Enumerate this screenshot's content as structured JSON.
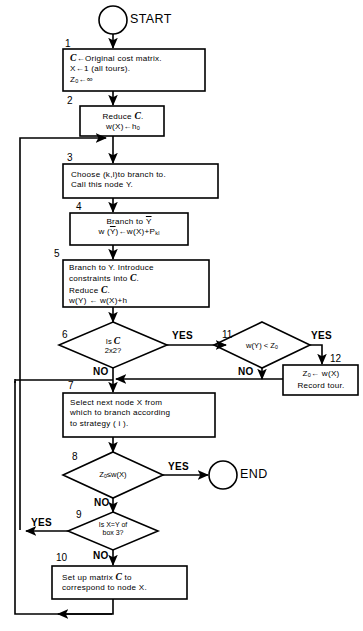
{
  "diagram": {
    "terminals": {
      "start": "START",
      "end": "END"
    },
    "numbers": {
      "n1": "1",
      "n2": "2",
      "n3": "3",
      "n4": "4",
      "n5": "5",
      "n6": "6",
      "n7": "7",
      "n8": "8",
      "n9": "9",
      "n10": "10",
      "n11": "11",
      "n12": "12"
    },
    "nodes": {
      "box1": {
        "line1_sym": "C",
        "line1": "←Original cost matrix.",
        "line2": "X←1 (all tours).",
        "line3_sym": "Z",
        "line3_sub": "0",
        "line3": "←∞"
      },
      "box2": {
        "line1": "Reduce",
        "line1_sym": "C",
        "line1_end": ".",
        "line2": "w(X)←h",
        "line2_sub": "0"
      },
      "box3": {
        "line1": "Choose (k,l)to branch to.",
        "line2": "Call this node Y."
      },
      "box4": {
        "line1": "Branch to",
        "line1_ovr": "Y",
        "line2a": "w (",
        "line2_ovr": "Y",
        "line2b": ")←w(X)+P",
        "line2_sub": "kl"
      },
      "box5": {
        "line1": "Branch to Y. Introduce",
        "line2": "constraints into",
        "line2_sym": "C",
        "line2_end": ".",
        "line3": "Reduce",
        "line3_sym": "C",
        "line3_end": ".",
        "line4": "w(Y) ← w(X)+h"
      },
      "diamond6": {
        "line1": "Is",
        "line1_sym": "C",
        "line2": "2x2?"
      },
      "box7": {
        "line1": "Select next node X from",
        "line2": "which to branch according",
        "line3": "to strategy ( i )."
      },
      "diamond8": {
        "text_sym": "Z",
        "text_sub": "0",
        "text": "≤w(X)"
      },
      "diamond9": {
        "line1": "Is X=Y of",
        "line2": "box 3?"
      },
      "box10": {
        "line1": "Set up matrix",
        "line1_sym": "C",
        "line1_end": " to",
        "line2": "correspond to node X."
      },
      "diamond11": {
        "text": "w(Y) < Z",
        "text_sub": "0"
      },
      "box12": {
        "line1_sym": "Z",
        "line1_sub": "0",
        "line1": "← w(X)",
        "line2": "Record tour."
      }
    },
    "edge_labels": {
      "yes6": "YES",
      "no6": "NO",
      "yes11": "YES",
      "no11": "NO",
      "yes8": "YES",
      "no8": "NO",
      "yes9": "YES",
      "no9": "NO"
    },
    "colors": {
      "stroke": "#000000",
      "background": "#ffffff"
    }
  }
}
